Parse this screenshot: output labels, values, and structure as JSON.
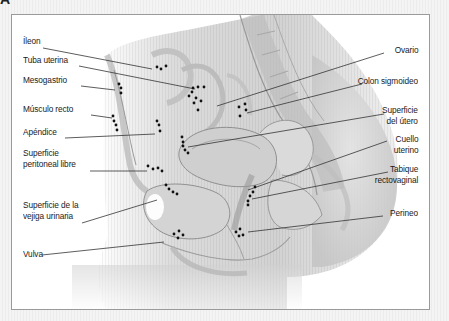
{
  "figure": {
    "panel_letter": "A",
    "colors": {
      "background": "#f2f2f2",
      "panel": "#ffffff",
      "frame": "#9a9a9a",
      "text": "#1a1a1a",
      "leader_line": "#333333",
      "dots": "#111111",
      "anatomy_shade": "#c8c8c8"
    }
  },
  "labels_left": [
    {
      "id": "ileon",
      "text": "Íleon",
      "lines": [
        "Íleon"
      ],
      "x": 22,
      "y": 41
    },
    {
      "id": "tuba-uterina",
      "text": "Tuba uterina",
      "lines": [
        "Tuba uterina"
      ],
      "x": 22,
      "y": 59
    },
    {
      "id": "mesogastrio",
      "text": "Mesogastrio",
      "lines": [
        "Mesogastrio"
      ],
      "x": 22,
      "y": 79
    },
    {
      "id": "musculo-recto",
      "text": "Músculo recto",
      "lines": [
        "Músculo recto"
      ],
      "x": 22,
      "y": 108
    },
    {
      "id": "apendice",
      "text": "Apéndice",
      "lines": [
        "Apéndice"
      ],
      "x": 22,
      "y": 131
    },
    {
      "id": "superficie-peritoneal-libre",
      "text": "Superficie peritoneal libre",
      "lines": [
        "Superficie",
        "peritoneal libre"
      ],
      "x": 22,
      "y": 151
    },
    {
      "id": "superficie-vejiga-urinaria",
      "text": "Superficie de la vejiga urinaria",
      "lines": [
        "Superficie de la",
        "vejiga urinaria"
      ],
      "x": 22,
      "y": 203
    },
    {
      "id": "vulva",
      "text": "Vulva",
      "lines": [
        "Vulva"
      ],
      "x": 22,
      "y": 252
    }
  ],
  "labels_right": [
    {
      "id": "ovario",
      "text": "Ovario",
      "lines": [
        "Ovario"
      ],
      "right": 416,
      "y": 47
    },
    {
      "id": "colon-sigmoideo",
      "text": "Colon sigmoideo",
      "lines": [
        "Colon sigmoideo"
      ],
      "right": 416,
      "y": 78
    },
    {
      "id": "superficie-del-utero",
      "text": "Superficie del útero",
      "lines": [
        "Superficie",
        "del útero"
      ],
      "right": 416,
      "y": 108
    },
    {
      "id": "cuello-uterino",
      "text": "Cuello uterino",
      "lines": [
        "Cuello",
        "uterino"
      ],
      "right": 416,
      "y": 136
    },
    {
      "id": "tabique-rectovaginal",
      "text": "Tabique rectovaginal",
      "lines": [
        "Tabique",
        "rectovaginal"
      ],
      "right": 416,
      "y": 166
    },
    {
      "id": "perineo",
      "text": "Perineo",
      "lines": [
        "Perineo"
      ],
      "right": 416,
      "y": 209
    }
  ]
}
